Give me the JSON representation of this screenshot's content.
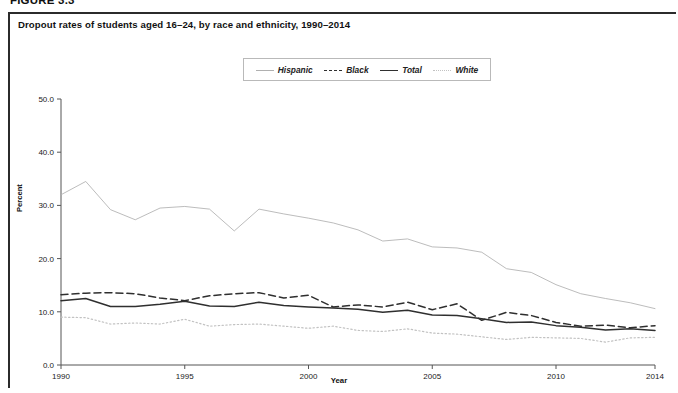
{
  "figure": {
    "number_label": "FIGURE 3.3",
    "title": "Dropout rates of students aged 16–24, by race and ethnicity, 1990–2014"
  },
  "axes": {
    "y_title": "Percent",
    "x_title": "Year",
    "y_ticks": [
      "0.0",
      "10.0",
      "20.0",
      "30.0",
      "40.0",
      "50.0"
    ],
    "x_ticks": [
      "1990",
      "1995",
      "2000",
      "2005",
      "2010",
      "2014"
    ]
  },
  "legend": {
    "position": "top-center",
    "items": [
      {
        "label": "Hispanic",
        "style": "solid-light",
        "color": "#b0b0b0",
        "icon": "line-swatch-icon"
      },
      {
        "label": "Black",
        "style": "dashed",
        "color": "#2f2f2f",
        "icon": "line-swatch-icon"
      },
      {
        "label": "Total",
        "style": "solid-dark",
        "color": "#2f2f2f",
        "icon": "line-swatch-icon"
      },
      {
        "label": "White",
        "style": "dotted",
        "color": "#c2c2c2",
        "icon": "line-swatch-icon"
      }
    ]
  },
  "chart_data": {
    "type": "line",
    "title": "Dropout rates of students aged 16–24, by race and ethnicity, 1990–2014",
    "xlabel": "Year",
    "ylabel": "Percent",
    "xlim": [
      1990,
      2014
    ],
    "ylim": [
      0.0,
      50.0
    ],
    "ytick_interval": 10.0,
    "grid": false,
    "x": [
      1990,
      1991,
      1992,
      1993,
      1994,
      1995,
      1996,
      1997,
      1998,
      1999,
      2000,
      2001,
      2002,
      2003,
      2004,
      2005,
      2006,
      2007,
      2008,
      2009,
      2010,
      2011,
      2012,
      2013,
      2014
    ],
    "series": [
      {
        "name": "Hispanic",
        "color": "#b0b0b0",
        "style": "solid-light",
        "values": [
          32.0,
          34.5,
          29.2,
          27.3,
          29.5,
          29.8,
          29.3,
          25.2,
          29.3,
          28.4,
          27.6,
          26.7,
          25.4,
          23.3,
          23.7,
          22.2,
          22.0,
          21.2,
          18.1,
          17.4,
          15.1,
          13.4,
          12.5,
          11.7,
          10.6
        ]
      },
      {
        "name": "Black",
        "color": "#2f2f2f",
        "style": "dashed",
        "values": [
          13.2,
          13.5,
          13.6,
          13.4,
          12.6,
          12.1,
          13.0,
          13.4,
          13.6,
          12.6,
          13.1,
          10.9,
          11.3,
          10.9,
          11.8,
          10.4,
          11.5,
          8.4,
          9.9,
          9.3,
          8.0,
          7.3,
          7.5,
          7.0,
          7.4
        ]
      },
      {
        "name": "Total",
        "color": "#2f2f2f",
        "style": "solid-dark",
        "values": [
          12.1,
          12.5,
          11.0,
          11.0,
          11.4,
          12.0,
          11.1,
          11.0,
          11.8,
          11.2,
          10.9,
          10.7,
          10.5,
          9.9,
          10.3,
          9.4,
          9.3,
          8.7,
          8.0,
          8.1,
          7.4,
          7.1,
          6.6,
          6.8,
          6.5
        ]
      },
      {
        "name": "White",
        "color": "#c2c2c2",
        "style": "dotted",
        "values": [
          9.0,
          8.9,
          7.7,
          7.9,
          7.7,
          8.6,
          7.3,
          7.6,
          7.7,
          7.3,
          6.9,
          7.3,
          6.5,
          6.3,
          6.8,
          6.0,
          5.8,
          5.3,
          4.8,
          5.2,
          5.1,
          5.0,
          4.3,
          5.1,
          5.2
        ]
      }
    ]
  }
}
